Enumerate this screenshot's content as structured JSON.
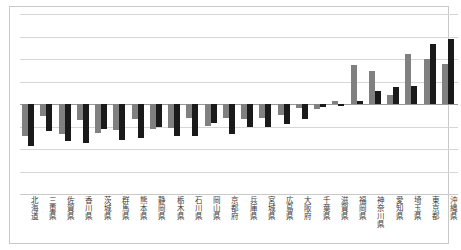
{
  "chart_data": {
    "type": "bar",
    "title": "",
    "subtitle": "",
    "xlabel": "",
    "ylabel": "",
    "grid": true,
    "legend_position": "none",
    "orientation": "vertical",
    "ylim": [
      -50,
      50
    ],
    "yticks": [
      50,
      37.5,
      25,
      12.5,
      0,
      -12.5,
      -25,
      -37.5,
      -50
    ],
    "ytick_labels": [
      "",
      "",
      "",
      "",
      "",
      "",
      "",
      "",
      ""
    ],
    "categories": [
      "北海道",
      "三重県",
      "佐賀県",
      "香川県",
      "茨城県",
      "群馬県",
      "熊本県",
      "静岡県",
      "栃木県",
      "石川県",
      "岡山県",
      "京都府",
      "兵庫県",
      "宮城県",
      "広島県",
      "大阪府",
      "千葉県",
      "滋賀県",
      "福岡県",
      "神奈川県",
      "愛知県",
      "埼玉県",
      "東京都",
      "沖縄県"
    ],
    "series": [
      {
        "name": "series-a",
        "color": "#808080",
        "values": [
          -18.0,
          -6.5,
          -16.5,
          -9.0,
          -16.0,
          -14.5,
          -8.5,
          -14.0,
          -13.5,
          -7.5,
          -12.0,
          -8.0,
          -8.5,
          -7.5,
          -6.0,
          -2.0,
          -3.0,
          1.5,
          21.5,
          18.5,
          5.0,
          28.0,
          25.0,
          22.0
        ]
      },
      {
        "name": "series-b",
        "color": "#1a1a1a",
        "values": [
          -23.5,
          -15.0,
          -20.5,
          -21.5,
          -14.0,
          -20.0,
          -19.0,
          -12.5,
          -17.5,
          -17.5,
          -10.5,
          -16.5,
          -13.0,
          -12.5,
          -11.0,
          -8.5,
          -1.5,
          -1.0,
          1.5,
          7.5,
          9.5,
          10.0,
          33.5,
          36.0
        ]
      }
    ]
  },
  "axes": {
    "zero_line_color": "#9a9a9a",
    "grid_color": "#d6d6d6",
    "frame_color": "#c9c9c9"
  }
}
